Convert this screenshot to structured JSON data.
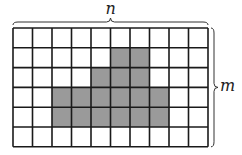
{
  "diagram": {
    "rows": 6,
    "cols": 10,
    "grid": {
      "x": 13,
      "y": 28,
      "cell_w": 19.5,
      "cell_h": 19.8
    },
    "colors": {
      "line": "#1a1a1a",
      "fill": "#9a9a9a",
      "empty": "#ffffff"
    },
    "shaded_cells": [
      [
        1,
        5
      ],
      [
        1,
        6
      ],
      [
        2,
        4
      ],
      [
        2,
        5
      ],
      [
        2,
        6
      ],
      [
        3,
        2
      ],
      [
        3,
        3
      ],
      [
        3,
        4
      ],
      [
        3,
        5
      ],
      [
        3,
        6
      ],
      [
        3,
        7
      ],
      [
        4,
        2
      ],
      [
        4,
        3
      ],
      [
        4,
        4
      ],
      [
        4,
        5
      ],
      [
        4,
        6
      ],
      [
        4,
        7
      ]
    ],
    "labels": {
      "top": "n",
      "right": "m"
    }
  }
}
